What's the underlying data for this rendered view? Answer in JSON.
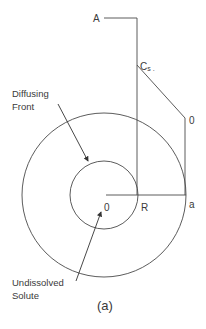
{
  "diagram": {
    "caption": "(a)",
    "labels": {
      "A": "A",
      "Cs": "Cs",
      "Cs_dot": ".",
      "zero_top": "0",
      "origin": "0",
      "R": "R",
      "a": "a",
      "diffusing_front_line1": "Diffusing",
      "diffusing_front_line2": "Front",
      "undissolved_line1": "Undissolved",
      "undissolved_line2": "Solute"
    },
    "colors": {
      "stroke": "#4a4a4a",
      "text": "#3a3a3a",
      "background": "#ffffff"
    }
  }
}
